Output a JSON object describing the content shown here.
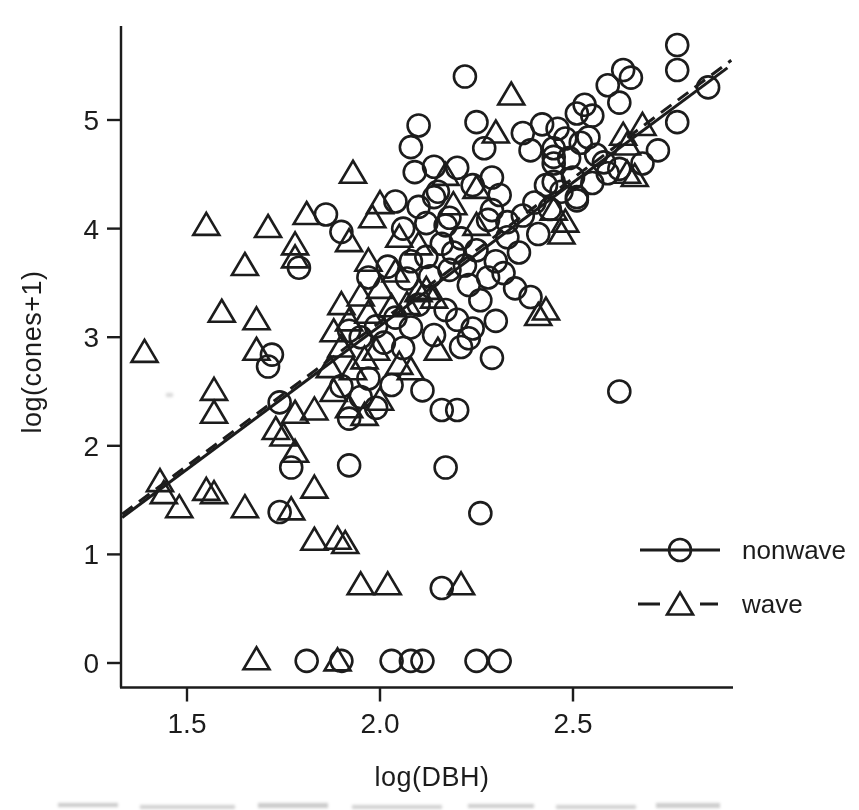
{
  "chart_data": {
    "type": "scatter",
    "title": "",
    "xlabel": "log(DBH)",
    "ylabel": "log(cones+1)",
    "xlim": [
      1.33,
      2.91
    ],
    "ylim": [
      -0.22,
      5.9
    ],
    "grid": false,
    "ink_color": "#1b1b1b",
    "x_ticks": [
      1.5,
      2.0,
      2.5
    ],
    "x_tick_labels": [
      "1.5",
      "2.0",
      "2.5"
    ],
    "y_ticks": [
      0,
      1,
      2,
      3,
      4,
      5
    ],
    "y_tick_labels": [
      "0",
      "1",
      "2",
      "3",
      "4",
      "5"
    ],
    "legend": {
      "position": "right-lower",
      "items": [
        {
          "label": "nonwave",
          "marker": "circle",
          "line": "solid"
        },
        {
          "label": "wave",
          "marker": "triangle",
          "line": "dashed"
        }
      ]
    },
    "fit_lines": [
      {
        "series": "nonwave",
        "style": "solid",
        "x1": 1.332,
        "y1": 1.34,
        "x2": 2.9,
        "y2": 5.48
      },
      {
        "series": "wave",
        "style": "dashed",
        "x1": 1.332,
        "y1": 1.37,
        "x2": 2.91,
        "y2": 5.55
      }
    ],
    "series": [
      {
        "name": "nonwave",
        "marker": "circle",
        "points": [
          [
            2.22,
            5.4
          ],
          [
            2.77,
            5.69
          ],
          [
            2.77,
            5.46
          ],
          [
            2.63,
            5.46
          ],
          [
            2.65,
            5.39
          ],
          [
            2.59,
            5.32
          ],
          [
            2.85,
            5.3
          ],
          [
            2.62,
            5.16
          ],
          [
            2.53,
            5.14
          ],
          [
            2.51,
            5.06
          ],
          [
            2.55,
            5.04
          ],
          [
            2.25,
            4.98
          ],
          [
            2.1,
            4.95
          ],
          [
            2.42,
            4.96
          ],
          [
            2.46,
            4.92
          ],
          [
            2.77,
            4.98
          ],
          [
            2.08,
            4.75
          ],
          [
            2.27,
            4.74
          ],
          [
            2.39,
            4.72
          ],
          [
            2.72,
            4.72
          ],
          [
            2.54,
            4.84
          ],
          [
            2.52,
            4.79
          ],
          [
            2.48,
            4.83
          ],
          [
            2.45,
            4.74
          ],
          [
            2.37,
            4.88
          ],
          [
            2.09,
            4.52
          ],
          [
            2.14,
            4.57
          ],
          [
            2.2,
            4.56
          ],
          [
            2.49,
            4.65
          ],
          [
            2.45,
            4.6
          ],
          [
            2.58,
            4.61
          ],
          [
            2.59,
            4.51
          ],
          [
            2.5,
            4.47
          ],
          [
            2.29,
            4.47
          ],
          [
            2.45,
            4.66
          ],
          [
            2.45,
            4.43
          ],
          [
            2.51,
            4.26
          ],
          [
            2.56,
            4.68
          ],
          [
            2.43,
            4.4
          ],
          [
            2.15,
            4.34
          ],
          [
            2.51,
            4.29
          ],
          [
            2.04,
            4.25
          ],
          [
            2.1,
            4.2
          ],
          [
            2.14,
            4.29
          ],
          [
            2.17,
            4.03
          ],
          [
            2.12,
            4.05
          ],
          [
            2.06,
            4.0
          ],
          [
            1.9,
            3.97
          ],
          [
            1.86,
            4.13
          ],
          [
            2.18,
            4.1
          ],
          [
            2.29,
            4.17
          ],
          [
            2.4,
            4.24
          ],
          [
            2.33,
            4.06
          ],
          [
            2.24,
            4.4
          ],
          [
            2.31,
            4.31
          ],
          [
            2.37,
            4.12
          ],
          [
            2.28,
            4.08
          ],
          [
            2.44,
            4.18
          ],
          [
            2.47,
            4.34
          ],
          [
            2.55,
            4.42
          ],
          [
            2.62,
            4.55
          ],
          [
            2.68,
            4.6
          ],
          [
            1.79,
            3.64
          ],
          [
            2.12,
            3.74
          ],
          [
            2.07,
            3.54
          ],
          [
            2.18,
            3.62
          ],
          [
            2.23,
            3.48
          ],
          [
            2.32,
            3.59
          ],
          [
            2.39,
            3.37
          ],
          [
            2.21,
            3.91
          ],
          [
            2.25,
            3.8
          ],
          [
            2.3,
            3.7
          ],
          [
            2.36,
            3.78
          ],
          [
            2.16,
            3.86
          ],
          [
            2.02,
            3.65
          ],
          [
            1.97,
            3.55
          ],
          [
            2.28,
            3.55
          ],
          [
            2.35,
            3.45
          ],
          [
            2.08,
            3.7
          ],
          [
            2.13,
            3.56
          ],
          [
            2.22,
            3.66
          ],
          [
            2.19,
            3.78
          ],
          [
            2.41,
            3.95
          ],
          [
            2.33,
            3.92
          ],
          [
            2.08,
            3.09
          ],
          [
            2.14,
            3.02
          ],
          [
            2.21,
            2.91
          ],
          [
            2.23,
            2.99
          ],
          [
            2.24,
            3.08
          ],
          [
            2.26,
            3.34
          ],
          [
            2.3,
            3.15
          ],
          [
            2.17,
            3.25
          ],
          [
            2.1,
            3.3
          ],
          [
            2.04,
            3.18
          ],
          [
            1.99,
            3.1
          ],
          [
            1.95,
            3.0
          ],
          [
            2.01,
            2.95
          ],
          [
            2.06,
            2.9
          ],
          [
            2.29,
            2.81
          ],
          [
            2.2,
            3.16
          ],
          [
            1.92,
            3.06
          ],
          [
            1.74,
            2.4
          ],
          [
            1.72,
            2.84
          ],
          [
            1.71,
            2.73
          ],
          [
            2.11,
            2.51
          ],
          [
            2.16,
            2.33
          ],
          [
            2.2,
            2.33
          ],
          [
            1.9,
            2.55
          ],
          [
            1.95,
            2.45
          ],
          [
            1.99,
            2.35
          ],
          [
            1.92,
            2.25
          ],
          [
            2.62,
            2.5
          ],
          [
            1.97,
            2.62
          ],
          [
            2.03,
            2.56
          ],
          [
            1.92,
            1.82
          ],
          [
            2.17,
            1.8
          ],
          [
            1.77,
            1.8
          ],
          [
            1.74,
            1.39
          ],
          [
            2.26,
            1.38
          ],
          [
            2.16,
            0.69
          ],
          [
            1.81,
            0.02
          ],
          [
            1.9,
            0.02
          ],
          [
            2.03,
            0.02
          ],
          [
            2.08,
            0.02
          ],
          [
            2.11,
            0.02
          ],
          [
            2.25,
            0.02
          ],
          [
            2.31,
            0.02
          ]
        ]
      },
      {
        "name": "wave",
        "marker": "triangle",
        "points": [
          [
            1.39,
            2.86
          ],
          [
            1.43,
            1.67
          ],
          [
            1.44,
            1.56
          ],
          [
            1.48,
            1.43
          ],
          [
            1.55,
            1.59
          ],
          [
            1.57,
            1.56
          ],
          [
            1.65,
            1.43
          ],
          [
            1.77,
            1.41
          ],
          [
            1.55,
            4.03
          ],
          [
            1.71,
            4.01
          ],
          [
            1.81,
            4.13
          ],
          [
            1.78,
            3.85
          ],
          [
            1.65,
            3.66
          ],
          [
            1.78,
            3.73
          ],
          [
            1.59,
            3.23
          ],
          [
            1.68,
            3.16
          ],
          [
            1.68,
            2.88
          ],
          [
            1.57,
            2.51
          ],
          [
            1.57,
            2.3
          ],
          [
            1.73,
            2.15
          ],
          [
            1.75,
            2.09
          ],
          [
            1.78,
            2.3
          ],
          [
            1.83,
            2.33
          ],
          [
            1.78,
            1.94
          ],
          [
            1.83,
            1.61
          ],
          [
            1.83,
            1.13
          ],
          [
            1.89,
            1.14
          ],
          [
            1.91,
            1.1
          ],
          [
            1.95,
            0.72
          ],
          [
            2.02,
            0.72
          ],
          [
            2.21,
            0.72
          ],
          [
            1.68,
            0.03
          ],
          [
            1.89,
            0.02
          ],
          [
            1.93,
            2.7
          ],
          [
            1.96,
            2.8
          ],
          [
            1.9,
            2.91
          ],
          [
            1.88,
            3.05
          ],
          [
            1.92,
            3.15
          ],
          [
            1.97,
            3.22
          ],
          [
            2.03,
            3.28
          ],
          [
            1.99,
            2.88
          ],
          [
            2.05,
            2.75
          ],
          [
            2.08,
            2.7
          ],
          [
            2.15,
            2.88
          ],
          [
            2.14,
            3.36
          ],
          [
            1.9,
            3.3
          ],
          [
            1.95,
            3.38
          ],
          [
            2.0,
            3.45
          ],
          [
            1.92,
            2.35
          ],
          [
            1.96,
            2.28
          ],
          [
            2.0,
            2.42
          ],
          [
            1.88,
            2.5
          ],
          [
            2.07,
            3.3
          ],
          [
            2.1,
            3.42
          ],
          [
            1.87,
            2.72
          ],
          [
            2.43,
            3.25
          ],
          [
            2.41,
            3.2
          ],
          [
            1.93,
            4.51
          ],
          [
            2.0,
            4.23
          ],
          [
            1.98,
            4.1
          ],
          [
            2.17,
            4.49
          ],
          [
            2.25,
            4.37
          ],
          [
            2.25,
            4.03
          ],
          [
            1.92,
            3.88
          ],
          [
            2.34,
            5.23
          ],
          [
            2.3,
            4.88
          ],
          [
            2.64,
            4.51
          ],
          [
            2.66,
            4.48
          ],
          [
            2.68,
            4.95
          ],
          [
            2.63,
            4.86
          ],
          [
            2.64,
            4.77
          ],
          [
            2.45,
            4.17
          ],
          [
            2.48,
            4.06
          ],
          [
            2.47,
            3.95
          ],
          [
            2.19,
            4.22
          ],
          [
            2.05,
            3.92
          ],
          [
            2.1,
            3.85
          ],
          [
            1.97,
            3.7
          ],
          [
            2.04,
            3.6
          ],
          [
            2.12,
            3.44
          ]
        ]
      }
    ]
  }
}
